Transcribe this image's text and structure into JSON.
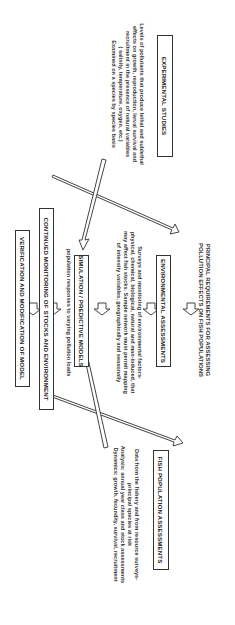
{
  "diagram": {
    "title_line1": "PRINCIPAL REQUIREMENTS FOR ASSESSING",
    "title_line2": "POLLUTION EFFECTS ON FISH POPULATIONS",
    "boxes": {
      "fish": "FISH POPULATION ASSESSMENTS",
      "environmental": "ENVIRONMENTAL ASSESSMENTS",
      "experimental": "EXPERIMENTAL STUDIES",
      "simulation": "SIMULATION / PREDICTIVE MODELS",
      "monitoring": "CONTINUED MONITORING OF STOCKS AND ENVIRONMENT",
      "verification": "VERIFICATION AND MODIFICATION OF MODEL"
    },
    "descriptions": {
      "fish": [
        "Data from the fishery and from resource surveys-",
        "principal species at risk",
        "Analysis: annual year class and stock assessments",
        "Dynamics: growth, fecundity, survival, recruitment"
      ],
      "environmental": [
        "Surveys and monitoring of environmental factors-",
        "physical, chemical, biological, natural and man-induced, that",
        "may affect fish stocks. Sample network must permit mapping",
        "of intensity variables, geographically and seasonally"
      ],
      "experimental": [
        "Levels of pollutants that produce lethal and sublethal",
        "effects on growth, reproduction, larval survival and",
        "recruitment in the presence of natural variables",
        "( salinity, temperature, oxygen, etc.)",
        "Examined on a species by species basis"
      ],
      "simulation": [
        "population responses to varying pollution loads"
      ]
    },
    "colors": {
      "line": "#333333",
      "background": "#ffffff"
    }
  }
}
